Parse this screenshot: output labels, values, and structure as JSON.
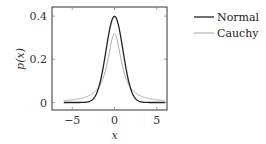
{
  "chart_data": {
    "type": "line",
    "title": "",
    "xlabel": "x",
    "ylabel": "p(x)",
    "xlim": [
      -7.4,
      6.2
    ],
    "ylim": [
      -0.037,
      0.44
    ],
    "xticks": [
      -5,
      0,
      5
    ],
    "xtick_labels": [
      "−5",
      "0",
      "5"
    ],
    "yticks": [
      0,
      0.2,
      0.4
    ],
    "ytick_labels": [
      "0",
      "0.2",
      "0.4"
    ],
    "grid": false,
    "legend_position": "outside-right-top",
    "x_domain": [
      -6,
      6
    ],
    "series": [
      {
        "name": "Normal",
        "color": "#222222",
        "width": 1.3,
        "formula": "exp(-x^2/2)/sqrt(2*pi)",
        "peak": 0.399
      },
      {
        "name": "Cauchy",
        "color": "#aaaaaa",
        "width": 1.0,
        "formula": "1/(pi*(1+x^2))",
        "peak": 0.318
      }
    ]
  },
  "legend": {
    "items": [
      {
        "label": "Normal"
      },
      {
        "label": "Cauchy"
      }
    ]
  }
}
